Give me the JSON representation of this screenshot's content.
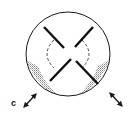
{
  "diagram": {
    "type": "schematic",
    "colors": {
      "stroke": "#1a1a1a",
      "shade": "#9a9a9a",
      "background": "#ffffff"
    },
    "circle": {
      "cx": 68,
      "cy": 54,
      "r": 42
    },
    "labels": [
      {
        "id": "c",
        "text": "c",
        "x": 11,
        "y": 106
      }
    ],
    "arrows": [
      {
        "id": "arrow-left",
        "x1": 24,
        "y1": 107,
        "x2": 36,
        "y2": 94,
        "heads": "both"
      },
      {
        "id": "arrow-right",
        "x1": 110,
        "y1": 93,
        "x2": 122,
        "y2": 106,
        "heads": "both"
      }
    ]
  }
}
